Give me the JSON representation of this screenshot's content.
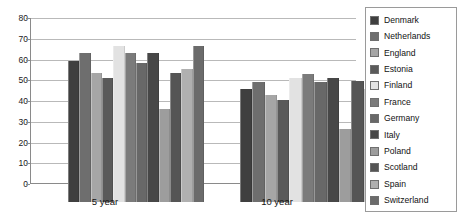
{
  "chart_data": {
    "type": "bar",
    "title": "",
    "xlabel": "",
    "ylabel": "",
    "categories": [
      "5 year",
      "10 year"
    ],
    "ylim": [
      0,
      80
    ],
    "yticks": [
      0,
      10,
      20,
      30,
      40,
      50,
      60,
      70,
      80
    ],
    "grid": true,
    "legend_position": "right",
    "series": [
      {
        "name": "Denmark",
        "color": "#3f3f3f",
        "values": [
          68,
          54.5
        ]
      },
      {
        "name": "Netherlands",
        "color": "#6e6e6e",
        "values": [
          72,
          58
        ]
      },
      {
        "name": "England",
        "color": "#a6a6a6",
        "values": [
          62,
          51.5
        ]
      },
      {
        "name": "Estonia",
        "color": "#5a5a5a",
        "values": [
          60,
          49
        ]
      },
      {
        "name": "Finland",
        "color": "#e2e2e2",
        "values": [
          75,
          60
        ]
      },
      {
        "name": "France",
        "color": "#7b7b7b",
        "values": [
          72,
          61.5
        ]
      },
      {
        "name": "Germany",
        "color": "#686868",
        "values": [
          67,
          58
        ]
      },
      {
        "name": "Italy",
        "color": "#474747",
        "values": [
          72,
          60
        ]
      },
      {
        "name": "Poland",
        "color": "#9d9d9d",
        "values": [
          45,
          35
        ]
      },
      {
        "name": "Scotland",
        "color": "#555555",
        "values": [
          62,
          58.5
        ]
      },
      {
        "name": "Spain",
        "color": "#b0b0b0",
        "values": [
          64,
          54.5
        ]
      },
      {
        "name": "Switzerland",
        "color": "#6b6b6b",
        "values": [
          75,
          null
        ]
      }
    ]
  },
  "axis": {
    "y_tick_labels": [
      "80",
      "70",
      "60",
      "50",
      "40",
      "30",
      "20",
      "10",
      "0"
    ],
    "x_group_labels": [
      "5 year",
      "10 year"
    ]
  },
  "legend": {
    "items": [
      {
        "label": "Denmark"
      },
      {
        "label": "Netherlands"
      },
      {
        "label": "England"
      },
      {
        "label": "Estonia"
      },
      {
        "label": "Finland"
      },
      {
        "label": "France"
      },
      {
        "label": "Germany"
      },
      {
        "label": "Italy"
      },
      {
        "label": "Poland"
      },
      {
        "label": "Scotland"
      },
      {
        "label": "Spain"
      },
      {
        "label": "Switzerland"
      }
    ]
  }
}
